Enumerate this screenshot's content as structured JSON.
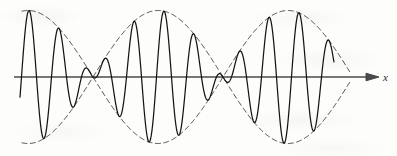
{
  "figure": {
    "title": "Beats: amplitude-modulated wave with dashed envelope",
    "background_color": "#fdfdfc",
    "wave_color": "#141414",
    "envelope_color": "#2b2b2b",
    "axis_color": "#4a4a4a",
    "axis_label": "x",
    "axis_arrow_icon": "arrow-right-icon",
    "width": 397,
    "height": 156
  },
  "chart_data": {
    "type": "line",
    "title": "Beats: amplitude-modulated wave with dashed envelope",
    "xlabel": "x",
    "ylabel": "",
    "grid": false,
    "legend": false,
    "xlim": [
      0,
      397
    ],
    "ylim": [
      -1.08,
      1.08
    ],
    "axis": {
      "y_pixel": 77,
      "x_start_pixel": 14,
      "x_end_pixel": 378,
      "arrow_tip_pixel": 378,
      "label": "x",
      "label_x_pixel": 383,
      "label_y_pixel": 72
    },
    "model": {
      "description": "y = A * cos(pi*(x - x0)/L_envelope) * cos(2*pi*(x - x0)/L_carrier)",
      "amplitude_pixels": 66.5,
      "baseline_y_pixel": 77,
      "carrier_period_pixels": 30,
      "carrier_half_period_pixels": 15,
      "envelope_half_period_pixels": 130,
      "envelope_node_pixels": [
        158,
        288
      ],
      "envelope_antinode_pixels": [
        78,
        223,
        348
      ],
      "envelope_top_peak_y_pixel": 11,
      "envelope_bottom_trough_y_pixel": 144,
      "wave_x_start_pixel": 20,
      "wave_x_end_pixel": 334,
      "envelope_x_start_pixel": 22,
      "envelope_x_end_pixel": 350,
      "carrier_phase_offset_pixels": 6
    },
    "series": [
      {
        "name": "carrier",
        "style": "solid",
        "color": "#141414",
        "linewidth": 1.25
      },
      {
        "name": "upper-envelope",
        "style": "dashed",
        "color": "#2b2b2b",
        "linewidth": 0.85,
        "dasharray": "5 3.5"
      },
      {
        "name": "lower-envelope",
        "style": "dashed",
        "color": "#2b2b2b",
        "linewidth": 0.85,
        "dasharray": "5 3.5"
      }
    ],
    "annotations": [
      {
        "text": "x",
        "x_pixel": 383,
        "y_pixel": 77,
        "style": "italic"
      }
    ]
  }
}
